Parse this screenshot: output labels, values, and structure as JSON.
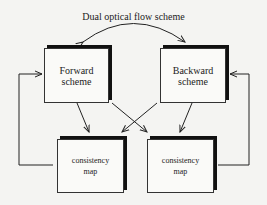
{
  "title": "Dual optical flow scheme",
  "nodes": {
    "forward": {
      "line1": "Forward",
      "line2": "scheme"
    },
    "backward": {
      "line1": "Backward",
      "line2": "scheme"
    },
    "consistency_left": {
      "line1": "consistency",
      "line2": "map"
    },
    "consistency_right": {
      "line1": "consistency",
      "line2": "map"
    }
  },
  "edges": [
    {
      "from": "forward",
      "to": "backward",
      "type": "curved-bidirectional"
    },
    {
      "from": "forward",
      "to": "consistency_left"
    },
    {
      "from": "forward",
      "to": "consistency_right"
    },
    {
      "from": "backward",
      "to": "consistency_left"
    },
    {
      "from": "backward",
      "to": "consistency_right"
    },
    {
      "from": "consistency_left",
      "to": "forward",
      "type": "feedback"
    },
    {
      "from": "consistency_right",
      "to": "backward",
      "type": "feedback"
    }
  ]
}
